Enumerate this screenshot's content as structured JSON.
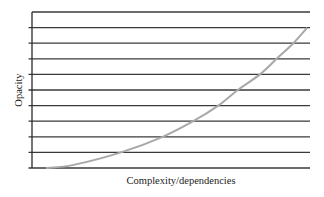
{
  "chart_data": {
    "type": "line",
    "title": "",
    "xlabel": "Complexity/dependencies",
    "ylabel": "Opacity",
    "xlim": [
      0,
      1
    ],
    "ylim": [
      0,
      10
    ],
    "grid": true,
    "grid_lines": 11,
    "tick_labels": {
      "x": [],
      "y": []
    },
    "legend": "none",
    "series": [
      {
        "name": "opacity-curve",
        "color": "#a8a8a8",
        "x": [
          0.05,
          0.15,
          0.32,
          0.47,
          0.58,
          0.67,
          0.74,
          0.82,
          0.88,
          0.94,
          0.99
        ],
        "y": [
          0,
          0.2,
          1,
          2,
          3,
          4,
          5,
          6,
          7,
          8,
          9
        ]
      }
    ]
  }
}
